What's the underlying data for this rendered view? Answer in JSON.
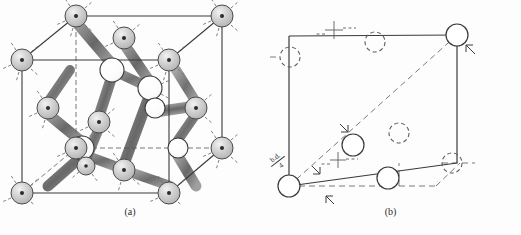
{
  "figure": {
    "background_color": "#fdfdfd",
    "panels": [
      {
        "id": "a",
        "caption": "(a)",
        "description": "Diamond-type cubic unit cell with shaded and open atoms joined by lobe-shaped bonds"
      },
      {
        "id": "b",
        "caption": "(b)",
        "description": "Line-drawing perspective of the same unit cell with solid and dashed circles"
      }
    ]
  },
  "panel_a": {
    "caption": "(a)",
    "colors": {
      "outline": "#3a3a3a",
      "shaded_atom_fill": "#cfcfcf",
      "shaded_atom_stroke": "#4a4a4a",
      "open_atom_fill": "#ffffff",
      "open_atom_stroke": "#3a3a3a",
      "bond_lobe": "#555555",
      "dashed_bond": "#6a6a6a"
    },
    "cube": {
      "front_face": [
        [
          22,
          193
        ],
        [
          169,
          193
        ],
        [
          169,
          60
        ],
        [
          22,
          60
        ]
      ],
      "back_face": [
        [
          76,
          148
        ],
        [
          222,
          148
        ],
        [
          222,
          16
        ],
        [
          76,
          16
        ]
      ]
    },
    "shaded_atoms": [
      {
        "cx": 22,
        "cy": 60,
        "r": 11
      },
      {
        "cx": 76,
        "cy": 16,
        "r": 11
      },
      {
        "cx": 222,
        "cy": 16,
        "r": 11
      },
      {
        "cx": 169,
        "cy": 60,
        "r": 11
      },
      {
        "cx": 22,
        "cy": 193,
        "r": 11
      },
      {
        "cx": 76,
        "cy": 148,
        "r": 11
      },
      {
        "cx": 222,
        "cy": 148,
        "r": 11
      },
      {
        "cx": 169,
        "cy": 193,
        "r": 11
      },
      {
        "cx": 124,
        "cy": 38,
        "r": 11
      },
      {
        "cx": 48,
        "cy": 108,
        "r": 11
      },
      {
        "cx": 196,
        "cy": 108,
        "r": 11
      },
      {
        "cx": 124,
        "cy": 170,
        "r": 11
      },
      {
        "cx": 99,
        "cy": 122,
        "r": 11
      },
      {
        "cx": 86,
        "cy": 166,
        "r": 9
      }
    ],
    "open_atoms": [
      {
        "cx": 112,
        "cy": 70,
        "r": 12
      },
      {
        "cx": 150,
        "cy": 88,
        "r": 12
      },
      {
        "cx": 155,
        "cy": 108,
        "r": 10
      },
      {
        "cx": 82,
        "cy": 148,
        "r": 12
      },
      {
        "cx": 178,
        "cy": 148,
        "r": 10
      }
    ],
    "atom_legend": {
      "shaded": "shaded sphere with central dot and radiating dashed bond stubs",
      "open": "white open circle"
    }
  },
  "panel_b": {
    "caption": "(b)",
    "colors": {
      "solid_line": "#3a3a3a",
      "dashed_line": "#6b6b6b",
      "circle_stroke": "#3a3a3a",
      "circle_fill": "#ffffff"
    },
    "annotation": {
      "numerator": "b.d.",
      "denominator": "4",
      "full_text": "b.d./4",
      "rotation_deg": -38
    },
    "outline_front": [
      [
        29,
        186
      ],
      [
        175,
        186
      ],
      [
        175,
        36
      ],
      [
        29,
        36
      ]
    ],
    "solid_circles": [
      {
        "cx": 29,
        "cy": 186,
        "r": 11
      },
      {
        "cx": 197,
        "cy": 35,
        "r": 11
      },
      {
        "cx": 93,
        "cy": 145,
        "r": 11
      },
      {
        "cx": 128,
        "cy": 178,
        "r": 11
      }
    ],
    "dashed_circles": [
      {
        "cx": 30,
        "cy": 57,
        "r": 10
      },
      {
        "cx": 115,
        "cy": 42,
        "r": 10
      },
      {
        "cx": 182,
        "cy": 163,
        "r": 10
      },
      {
        "cx": 139,
        "cy": 133,
        "r": 10
      }
    ],
    "cross_markers": [
      {
        "cx": 74,
        "cy": 30
      },
      {
        "cx": 78,
        "cy": 160
      }
    ],
    "tick_arrows": [
      {
        "x": 53,
        "y": 170
      },
      {
        "x": 73,
        "y": 200
      },
      {
        "x": 80,
        "y": 128
      },
      {
        "x": 208,
        "y": 50
      }
    ],
    "diagonal": {
      "from": [
        29,
        186
      ],
      "to": [
        197,
        35
      ]
    }
  }
}
